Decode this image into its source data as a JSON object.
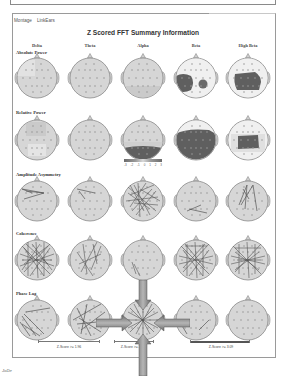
{
  "window": {
    "menu": [
      "Montage",
      "LinkEars"
    ],
    "title": "Z Scored FFT Summary Information"
  },
  "columns": [
    "Delta",
    "Theta",
    "Alpha",
    "Beta",
    "High Beta"
  ],
  "rows": [
    "Absolute Power",
    "Relative Power",
    "Amplitude Asymmetry",
    "Coherence",
    "Phase Lag"
  ],
  "colorbar": {
    "ticks": [
      "-3",
      "-2",
      "-1",
      "0",
      "1",
      "2",
      "3"
    ]
  },
  "zscore_labels": [
    "Z-Score >= 1.96",
    "Z-Score >= 2.58",
    "Z-Score >= 3.09"
  ],
  "footer": {
    "text": "JoDe"
  },
  "colors": {
    "head_fill": "#d6d6d6",
    "head_stroke": "#8a8a8a",
    "deviation_fill": "#5f5f5f",
    "arrow_fill": "#8c8c8c",
    "frame": "#9a9a9a"
  }
}
